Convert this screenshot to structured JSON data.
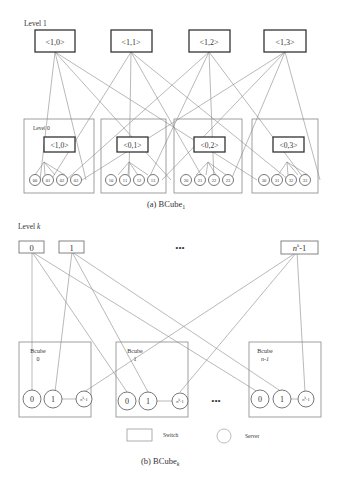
{
  "bcube1": {
    "level1_label": "Level 1",
    "level0_label": "Level 0",
    "level1_switches": [
      "<1,0>",
      "<1,1>",
      "<1,2>",
      "<1,3>"
    ],
    "level0_switches": [
      "<1,0>",
      "<0,1>",
      "<0,2>",
      "<0,3>"
    ],
    "servers": [
      [
        "00",
        "01",
        "02",
        "03"
      ],
      [
        "10",
        "11",
        "12",
        "13"
      ],
      [
        "20",
        "21",
        "22",
        "23"
      ],
      [
        "30",
        "31",
        "32",
        "33"
      ]
    ],
    "caption": "(a) BCube",
    "caption_sub": "1"
  },
  "bcubek": {
    "level_label": "Level ",
    "level_var": "k",
    "switches": [
      "0",
      "1",
      "n",
      "-1"
    ],
    "switch_last_sup": "k",
    "ellipsis": "•••",
    "groups": [
      {
        "title": "Bcube",
        "sub": "0"
      },
      {
        "title": "Bcube",
        "sub": "1"
      },
      {
        "title": "Bcube",
        "sub": "n-1"
      }
    ],
    "server_labels": [
      "0",
      "1",
      "n",
      "k",
      "-1"
    ],
    "legend": {
      "switch": "Switch",
      "server": "Server"
    },
    "caption": "(b) BCube",
    "caption_sub": "k"
  }
}
